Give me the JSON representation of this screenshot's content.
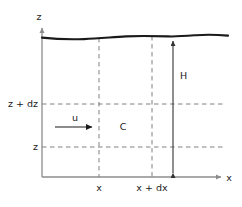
{
  "figure": {
    "type": "diagram",
    "background_color": "#ffffff",
    "axes": {
      "axis_color": "#8c8c8c",
      "origin": {
        "x": 42,
        "y": 177
      },
      "vertical_axis": {
        "label": "z",
        "label_pos": {
          "x": 39,
          "y": 20
        },
        "from": {
          "x": 42,
          "y": 177
        },
        "to": {
          "x": 42,
          "y": 28
        }
      },
      "horizontal_axis": {
        "label": "x",
        "label_pos": {
          "x": 229,
          "y": 181
        },
        "from": {
          "x": 42,
          "y": 177
        },
        "to": {
          "x": 221,
          "y": 177
        }
      }
    },
    "surface": {
      "name": "free-surface-wavy-line",
      "color": "#1a1a1a",
      "stroke_width": 2.1,
      "path": "M 42 37.6 C 56 39.2, 70 39.6, 84 39.1 C 98 38.6, 112 37.2, 126 36.4 C 140 35.6, 154 36.0, 168 36.4 C 178 36.7, 186 36.0, 196 35.2 C 206 34.4, 216 34.6, 228 35.6"
    },
    "dashed_color": "#808080",
    "vertical_dashed_lines": [
      {
        "name": "gridline-x",
        "x": 99,
        "y_top": 38,
        "y_bottom": 177
      },
      {
        "name": "gridline-x-plus-dx",
        "x": 152,
        "y_top": 36,
        "y_bottom": 177
      }
    ],
    "horizontal_dashed_lines": [
      {
        "name": "gridline-z-plus-dz",
        "y": 104,
        "x_left": 42,
        "x_right": 226
      },
      {
        "name": "gridline-z",
        "y": 147,
        "x_left": 42,
        "x_right": 226
      }
    ],
    "y_tick_labels": [
      {
        "name": "y-tick-label-z-plus-dz",
        "text": "z + dz",
        "x": 38,
        "y": 107,
        "anchor": "end"
      },
      {
        "name": "y-tick-label-z",
        "text": "z",
        "x": 38,
        "y": 150,
        "anchor": "end"
      }
    ],
    "x_tick_labels": [
      {
        "name": "x-tick-label-x",
        "text": "x",
        "x": 99,
        "y": 191,
        "anchor": "middle"
      },
      {
        "name": "x-tick-label-x-plus-dx",
        "text": "x + dx",
        "x": 152,
        "y": 191,
        "anchor": "middle"
      }
    ],
    "annotations": {
      "height_arrow": {
        "name": "height-dimension-arrow",
        "label": "H",
        "label_pos": {
          "x": 180,
          "y": 79
        },
        "x": 173,
        "y_top": 37,
        "y_bottom": 177,
        "color": "#333333"
      },
      "velocity_arrow": {
        "name": "velocity-arrow",
        "label": "u",
        "label_pos": {
          "x": 75,
          "y": 121
        },
        "x_start": 55,
        "x_end": 97,
        "y": 127,
        "color": "#1a1a1a"
      },
      "cell_label": {
        "name": "control-volume-label",
        "text": "C",
        "x": 123,
        "y": 130
      }
    }
  }
}
